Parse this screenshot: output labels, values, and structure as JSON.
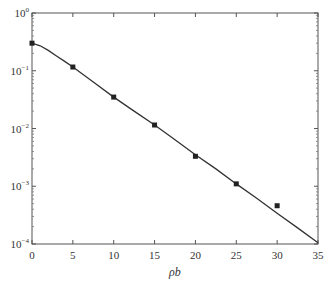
{
  "chart_data": {
    "type": "line",
    "title": "",
    "xlabel": "ρb",
    "ylabel": "",
    "xlim": [
      0,
      35
    ],
    "ylim": [
      0.0001,
      1
    ],
    "yscale": "log",
    "grid": false,
    "legend": null,
    "x_ticks": [
      0,
      5,
      10,
      15,
      20,
      25,
      30,
      35
    ],
    "y_ticks": [
      {
        "value": 1,
        "label_base": "10",
        "label_exp": "0"
      },
      {
        "value": 0.1,
        "label_base": "10",
        "label_exp": "−1"
      },
      {
        "value": 0.01,
        "label_base": "10",
        "label_exp": "−2"
      },
      {
        "value": 0.001,
        "label_base": "10",
        "label_exp": "−3"
      },
      {
        "value": 0.0001,
        "label_base": "10",
        "label_exp": "−4"
      }
    ],
    "series": [
      {
        "name": "theory (curve)",
        "style": "line",
        "color": "#333333",
        "x": [
          0,
          1,
          2,
          3,
          4,
          5,
          7.5,
          10,
          12.5,
          15,
          17.5,
          20,
          22.5,
          25,
          27.5,
          30,
          32.5,
          35
        ],
        "values": [
          0.3,
          0.27,
          0.225,
          0.18,
          0.145,
          0.116,
          0.064,
          0.035,
          0.02,
          0.0115,
          0.0064,
          0.0035,
          0.002,
          0.0011,
          0.00062,
          0.00034,
          0.00019,
          0.000105
        ]
      },
      {
        "name": "data (markers)",
        "style": "marker",
        "marker": "square",
        "color": "#222222",
        "x": [
          0,
          5,
          10,
          15,
          20,
          25,
          30
        ],
        "values": [
          0.3,
          0.116,
          0.035,
          0.0115,
          0.0033,
          0.0011,
          0.00046
        ]
      }
    ]
  },
  "plot_box": {
    "left": 32,
    "top": 13,
    "right": 318,
    "bottom": 244
  }
}
